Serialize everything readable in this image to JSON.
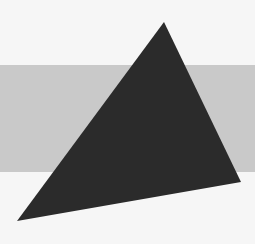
{
  "canvas": {
    "width": 255,
    "height": 244,
    "background_color": "#f6f6f6"
  },
  "shapes": {
    "band": {
      "type": "rect",
      "x": 0,
      "y": 65,
      "width": 255,
      "height": 107,
      "color": "#c9c9c9"
    },
    "triangle": {
      "type": "polygon",
      "points": [
        [
          164,
          22
        ],
        [
          241,
          182
        ],
        [
          17,
          221
        ]
      ],
      "color": "#2b2b2b"
    }
  }
}
